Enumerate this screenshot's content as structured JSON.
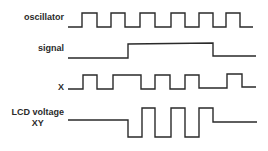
{
  "diagram": {
    "type": "timing-diagram",
    "stroke_color": "#2a2a2a",
    "background": "#ffffff",
    "signals": [
      {
        "name": "oscillator",
        "label": "oscillator",
        "points": "68,27 82,27 82,13 97,13 97,27 111,27 111,13 125,13 125,27 140,27 140,13 155,13 155,27 171,27 171,13 185,13 185,27 199,27 199,13 213,13 213,27 226,27 226,13 240,13 240,27 253,27"
      },
      {
        "name": "signal",
        "label": "signal",
        "points": "68,58 128,58 128,44 213,43 213,56 256,56"
      },
      {
        "name": "x",
        "label": "X",
        "points": "68,89 83,89 83,75 97,75 97,89 113,89 113,75 141,75 141,89 155,89 155,75 170,75 170,89 185,89 185,75 199,75 199,88 227,88 227,74 242,74 242,87 256,87"
      },
      {
        "name": "lcd-voltage-xy",
        "label_line1": "LCD voltage",
        "label_line2": "XY",
        "points": "68,120 128,120 128,137 142,137 142,108 155,108 155,137 171,137 171,108 185,108 185,137 199,137 199,108 213,108 213,122 257,122"
      }
    ]
  }
}
